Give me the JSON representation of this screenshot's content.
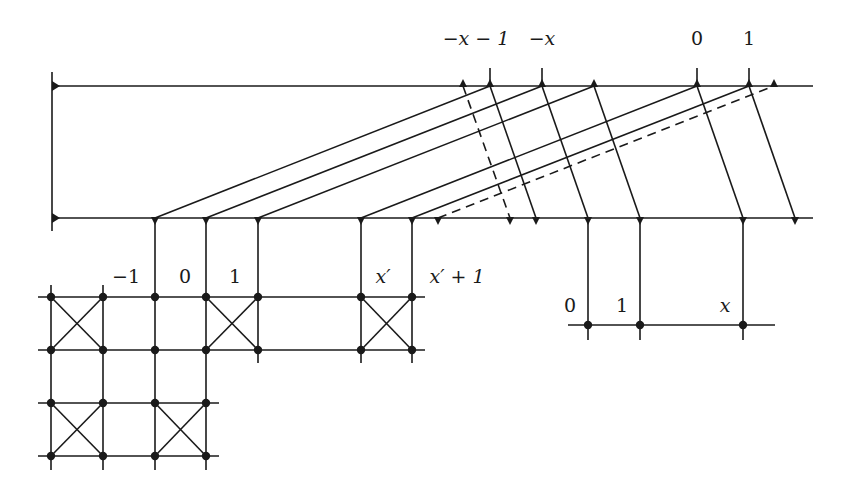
{
  "diagram": {
    "stroke_color": "#1a1a1a",
    "background": "#ffffff",
    "top_line": {
      "y": 86,
      "x1": 52,
      "x2": 813
    },
    "bottom_line": {
      "y": 218,
      "x1": 52,
      "x2": 813
    },
    "left_bar": {
      "x": 52,
      "y1": 72,
      "y2": 231
    },
    "top_nodes": [
      463,
      490,
      542,
      594,
      697,
      749,
      774
    ],
    "top_ticks": [
      {
        "x": 490,
        "y1": 68
      },
      {
        "x": 542,
        "y1": 68
      },
      {
        "x": 697,
        "y1": 68
      },
      {
        "x": 749,
        "y1": 68
      }
    ],
    "bottom_nodes": [
      155,
      206,
      258,
      361,
      412,
      438,
      510,
      536,
      588,
      640,
      743,
      795
    ],
    "rising_strands": [
      {
        "from": 155,
        "to": 490,
        "dashed": false
      },
      {
        "from": 206,
        "to": 542,
        "dashed": false
      },
      {
        "from": 258,
        "to": 594,
        "dashed": false
      },
      {
        "from": 361,
        "to": 697,
        "dashed": false
      },
      {
        "from": 412,
        "to": 749,
        "dashed": false
      },
      {
        "from": 438,
        "to": 774,
        "dashed": true
      }
    ],
    "falling_strands": [
      {
        "from": 463,
        "to": 510,
        "dashed": true
      },
      {
        "from": 490,
        "to": 536,
        "dashed": false
      },
      {
        "from": 542,
        "to": 588,
        "dashed": false
      },
      {
        "from": 594,
        "to": 640,
        "dashed": false
      },
      {
        "from": 697,
        "to": 743,
        "dashed": false
      },
      {
        "from": 749,
        "to": 795,
        "dashed": false
      }
    ],
    "grid": {
      "rows": [
        {
          "y": 297,
          "x1": 38,
          "x2": 425,
          "nodes": [
            51,
            103,
            155,
            206,
            258,
            361,
            412
          ]
        },
        {
          "y": 350,
          "x1": 38,
          "x2": 425,
          "nodes": [
            51,
            103,
            155,
            206,
            258,
            361,
            412
          ]
        },
        {
          "y": 403,
          "x1": 38,
          "x2": 219,
          "nodes": [
            51,
            103,
            155,
            206
          ]
        },
        {
          "y": 456,
          "x1": 38,
          "x2": 219,
          "nodes": [
            51,
            103,
            155,
            206
          ]
        }
      ],
      "columns": [
        {
          "x": 51,
          "y1": 285,
          "y2": 470
        },
        {
          "x": 103,
          "y1": 285,
          "y2": 470
        },
        {
          "x": 155,
          "y1": 218,
          "y2": 470
        },
        {
          "x": 206,
          "y1": 218,
          "y2": 470
        },
        {
          "x": 258,
          "y1": 218,
          "y2": 363
        },
        {
          "x": 361,
          "y1": 218,
          "y2": 363
        },
        {
          "x": 412,
          "y1": 218,
          "y2": 363
        }
      ],
      "crosses": [
        {
          "x1": 51,
          "y1": 297,
          "x2": 103,
          "y2": 350
        },
        {
          "x1": 206,
          "y1": 297,
          "x2": 258,
          "y2": 350
        },
        {
          "x1": 361,
          "y1": 297,
          "x2": 412,
          "y2": 350
        },
        {
          "x1": 51,
          "y1": 403,
          "x2": 103,
          "y2": 456
        },
        {
          "x1": 155,
          "y1": 403,
          "x2": 206,
          "y2": 456
        }
      ]
    },
    "right_bar": {
      "y": 325,
      "x1": 568,
      "x2": 775,
      "columns": [
        {
          "x": 588,
          "y1": 218,
          "y2": 340
        },
        {
          "x": 640,
          "y1": 218,
          "y2": 340
        },
        {
          "x": 743,
          "y1": 218,
          "y2": 340
        }
      ]
    },
    "labels": {
      "top": [
        {
          "text": "−x − 1",
          "x": 476,
          "y": 45
        },
        {
          "text": "−x",
          "x": 542,
          "y": 45
        },
        {
          "text": "0",
          "x": 697,
          "y": 45
        },
        {
          "text": "1",
          "x": 749,
          "y": 45
        }
      ],
      "grid": [
        {
          "text": "−1",
          "x": 126,
          "y": 283
        },
        {
          "text": "0",
          "x": 185,
          "y": 283
        },
        {
          "text": "1",
          "x": 235,
          "y": 283
        },
        {
          "text": "x′",
          "x": 383,
          "y": 283
        },
        {
          "text": "x′ + 1",
          "x": 457,
          "y": 283
        }
      ],
      "right": [
        {
          "text": "0",
          "x": 570,
          "y": 312
        },
        {
          "text": "1",
          "x": 622,
          "y": 312
        },
        {
          "text": "x",
          "x": 725,
          "y": 312
        }
      ]
    }
  }
}
